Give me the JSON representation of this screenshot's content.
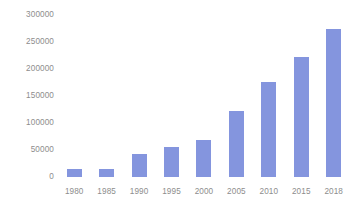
{
  "chart_data": {
    "type": "bar",
    "title": "",
    "subtitle": "",
    "xlabel": "",
    "ylabel": "",
    "categories": [
      "1980",
      "1985",
      "1990",
      "1995",
      "2000",
      "2005",
      "2010",
      "2015",
      "2018"
    ],
    "values": [
      14000,
      15000,
      43000,
      55000,
      68000,
      122000,
      176000,
      222000,
      274000
    ],
    "series": [
      {
        "name": "",
        "values": [
          14000,
          15000,
          43000,
          55000,
          68000,
          122000,
          176000,
          222000,
          274000
        ]
      }
    ],
    "ylim": [
      0,
      300000
    ],
    "ytick_labels": [
      "0",
      "50000",
      "100000",
      "150000",
      "200000",
      "250000",
      "300000"
    ],
    "ytick_values": [
      0,
      50000,
      100000,
      150000,
      200000,
      250000,
      300000
    ],
    "grid": false,
    "legend": "none",
    "bar_color": "#8495de",
    "label_color": "#8d8d8d",
    "background_color": "#ffffff"
  }
}
